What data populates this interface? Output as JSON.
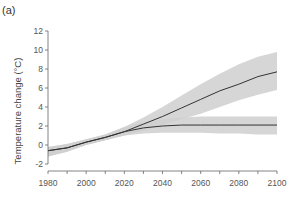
{
  "panel_label": "(a)",
  "chart_data": {
    "type": "line",
    "title": "",
    "panel_label": "(a)",
    "xlabel": "",
    "ylabel": "Temperature change (°C)",
    "xlim": [
      1980,
      2100
    ],
    "ylim": [
      -2,
      12
    ],
    "xticks": [
      1980,
      2000,
      2020,
      2040,
      2060,
      2080,
      2100
    ],
    "yticks": [
      -2,
      0,
      2,
      4,
      6,
      8,
      10,
      12
    ],
    "grid": false,
    "legend": null,
    "x": [
      1980,
      1990,
      2000,
      2010,
      2020,
      2030,
      2040,
      2050,
      2060,
      2070,
      2080,
      2090,
      2100
    ],
    "series": [
      {
        "name": "High scenario",
        "values": [
          -0.6,
          -0.3,
          0.3,
          0.8,
          1.4,
          2.2,
          3.0,
          3.9,
          4.8,
          5.7,
          6.4,
          7.2,
          7.7
        ],
        "band_upper": [
          -0.2,
          0.1,
          0.6,
          1.1,
          1.9,
          2.9,
          4.0,
          5.2,
          6.4,
          7.5,
          8.5,
          9.3,
          9.8
        ],
        "band_lower": [
          -1.2,
          -0.7,
          0.0,
          0.5,
          1.0,
          1.5,
          2.1,
          2.7,
          3.3,
          4.0,
          4.7,
          5.3,
          5.8
        ]
      },
      {
        "name": "Low scenario",
        "values": [
          -0.6,
          -0.3,
          0.3,
          0.8,
          1.4,
          1.8,
          2.0,
          2.1,
          2.1,
          2.1,
          2.1,
          2.1,
          2.1
        ],
        "band_upper": [
          -0.2,
          0.1,
          0.6,
          1.1,
          1.9,
          2.4,
          2.7,
          2.9,
          3.0,
          3.0,
          3.0,
          3.0,
          3.0
        ],
        "band_lower": [
          -1.2,
          -0.7,
          0.0,
          0.5,
          1.0,
          1.2,
          1.3,
          1.3,
          1.3,
          1.2,
          1.2,
          1.1,
          1.1
        ]
      }
    ],
    "colors": {
      "line": "#333333",
      "band": "#cfcfcf",
      "axis": "#666666"
    }
  }
}
